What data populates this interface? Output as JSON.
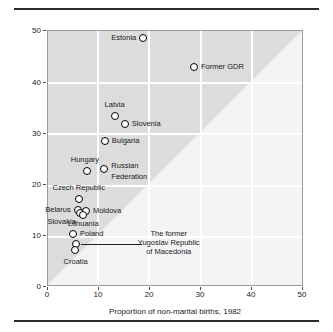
{
  "figure": {
    "background": "#ffffff",
    "plot_fill": "#dcdcdc",
    "wedge_fill": "#f4f4f4",
    "grid_color": "#ffffff"
  },
  "chart_data": {
    "type": "scatter",
    "title": "",
    "xlabel": "Proportion of non-marital births, 1982",
    "ylabel": "Proportion of non-marital births, 1996",
    "xlim": [
      0,
      50
    ],
    "ylim": [
      0,
      50
    ],
    "xticks": [
      0,
      10,
      20,
      30,
      40,
      50
    ],
    "yticks": [
      0,
      10,
      20,
      30,
      40,
      50
    ],
    "grid": true,
    "legend": "none",
    "annotations": [
      {
        "name": "macedonia-leader-line",
        "text": "The former Yugoslav Republic of Macedonia",
        "lines": [
          "The former",
          "Yugoslav Republic",
          "of Macedonia"
        ],
        "from": [
          5.6,
          8.3
        ],
        "to": [
          18.5,
          8.3
        ]
      }
    ],
    "points": [
      {
        "label": "Estonia",
        "x": 18.8,
        "y": 48.4,
        "label_pos": "left"
      },
      {
        "label": "Former GDR",
        "x": 28.7,
        "y": 42.8,
        "label_pos": "right"
      },
      {
        "label": "Latvia",
        "x": 13.2,
        "y": 33.2,
        "label_pos": "top"
      },
      {
        "label": "Slovenia",
        "x": 15.2,
        "y": 31.6,
        "label_pos": "right"
      },
      {
        "label": "Bulgaria",
        "x": 11.3,
        "y": 28.4,
        "label_pos": "right"
      },
      {
        "label": "Hungary",
        "x": 7.8,
        "y": 22.5,
        "label_pos": "topleft"
      },
      {
        "label": "Russian Federation",
        "x": 11.2,
        "y": 22.9,
        "label_pos": "right2"
      },
      {
        "label": "Czech Republic",
        "x": 6.2,
        "y": 17.0,
        "label_pos": "top"
      },
      {
        "label": "Belarus",
        "x": 6.0,
        "y": 14.8,
        "label_pos": "left"
      },
      {
        "label": "Moldova",
        "x": 7.6,
        "y": 14.7,
        "label_pos": "right"
      },
      {
        "label": "Slovakia",
        "x": 6.4,
        "y": 14.2,
        "label_pos": "bottomleft"
      },
      {
        "label": "Lithuania",
        "x": 7.1,
        "y": 13.9,
        "label_pos": "bottom"
      },
      {
        "label": "Poland",
        "x": 5.1,
        "y": 10.2,
        "label_pos": "right"
      },
      {
        "label": "The former Yugoslav Republic of Macedonia",
        "x": 5.6,
        "y": 8.3,
        "label_pos": "callout"
      },
      {
        "label": "Croatia",
        "x": 5.4,
        "y": 7.0,
        "label_pos": "bottomleft2"
      }
    ]
  }
}
